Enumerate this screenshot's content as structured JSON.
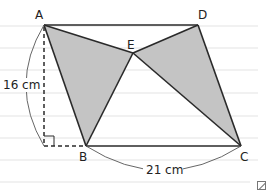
{
  "figure": {
    "points": {
      "A": {
        "label": "A",
        "x": 44,
        "y": 25
      },
      "D": {
        "label": "D",
        "x": 198,
        "y": 25
      },
      "E": {
        "label": "E",
        "x": 133,
        "y": 53
      },
      "B": {
        "label": "B",
        "x": 86,
        "y": 146
      },
      "C": {
        "label": "C",
        "x": 241,
        "y": 146
      },
      "F": {
        "x": 44,
        "y": 146
      }
    },
    "shaded_triangles": [
      "AEB",
      "DEC"
    ],
    "measurements": {
      "height": "16 cm",
      "base": "21 cm"
    },
    "colors": {
      "shade": "#c4c4c4",
      "line": "#2a2a2a",
      "ruled_line": "#e6e6e6",
      "arc": "#555555"
    },
    "ruled_lines_y": [
      26,
      48,
      70,
      93,
      116,
      138,
      160,
      182
    ]
  }
}
